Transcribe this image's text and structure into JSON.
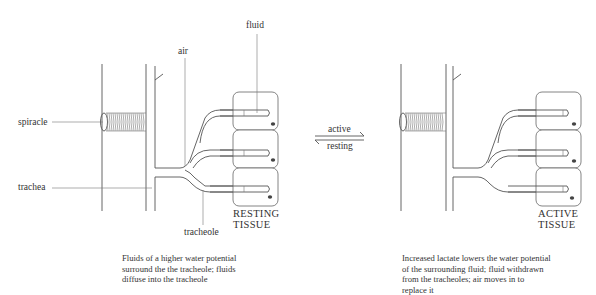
{
  "diagram": {
    "type": "biology-schematic",
    "left_panel": {
      "labels": {
        "fluid": "fluid",
        "air": "air",
        "spiracle": "spiracle",
        "trachea": "trachea",
        "tracheole": "tracheole"
      },
      "tissue_label_line1": "RESTING",
      "tissue_label_line2": "TISSUE",
      "caption": "Fluids of a higher water potential\nsurround the the tracheole; fluids\ndiffuse into the tracheole"
    },
    "transition": {
      "forward_label": "active",
      "reverse_label": "resting"
    },
    "right_panel": {
      "tissue_label_line1": "ACTIVE",
      "tissue_label_line2": "TISSUE",
      "caption": "Increased lactate lowers the water potential\nof the surrounding fluid; fluid withdrawn\nfrom the tracheoles; air moves in to\nreplace it"
    }
  }
}
